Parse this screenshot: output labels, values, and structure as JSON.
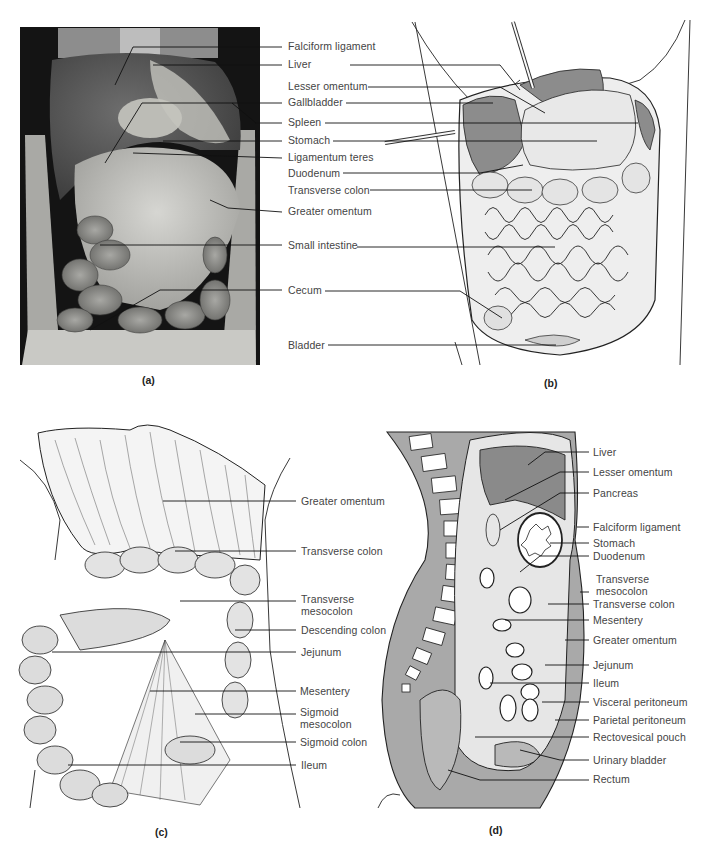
{
  "figure": {
    "panels": [
      {
        "id": "a",
        "caption": "(a)",
        "kind": "photograph of dissected abdominal cavity"
      },
      {
        "id": "b",
        "caption": "(b)",
        "kind": "illustration of opened abdomen"
      },
      {
        "id": "c",
        "caption": "(c)",
        "kind": "illustration with greater omentum reflected"
      },
      {
        "id": "d",
        "caption": "(d)",
        "kind": "sagittal section illustration"
      }
    ],
    "labels_ab": [
      "Falciform ligament",
      "Liver",
      "Lesser omentum",
      "Gallbladder",
      "Spleen",
      "Stomach",
      "Ligamentum teres",
      "Duodenum",
      "Transverse colon",
      "Greater omentum",
      "Small intestine",
      "Cecum",
      "Bladder"
    ],
    "labels_c": [
      "Greater omentum",
      "Transverse colon",
      "Transverse mesocolon",
      "Descending colon",
      "Jejunum",
      "Mesentery",
      "Sigmoid mesocolon",
      "Sigmoid colon",
      "Ileum"
    ],
    "labels_d": [
      "Liver",
      "Lesser omentum",
      "Pancreas",
      "Falciform ligament",
      "Stomach",
      "Duodenum",
      "Transverse mesocolon",
      "Transverse colon",
      "Mesentery",
      "Greater omentum",
      "Jejunum",
      "Ileum",
      "Visceral peritoneum",
      "Parietal peritoneum",
      "Rectovesical pouch",
      "Urinary bladder",
      "Rectum"
    ],
    "colors": {
      "background": "#ffffff",
      "photo_dark": "#1a1a1a",
      "organ_gray_dark": "#8a8a8a",
      "organ_gray_mid": "#b5b5b5",
      "organ_gray_light": "#e4e4e4",
      "line": "#2a2a2a",
      "label_text": "#444444"
    }
  }
}
